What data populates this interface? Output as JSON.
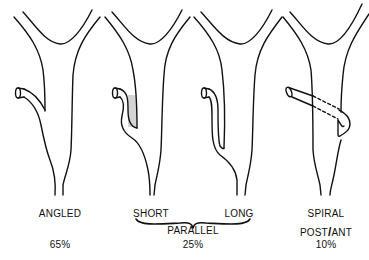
{
  "diagram": {
    "type": "anatomical schematic",
    "stroke_color": "#111111",
    "background": "#ffffff",
    "variants": [
      {
        "id": "angled",
        "label": "ANGLED",
        "percent": "65%"
      },
      {
        "id": "parallel-short",
        "label": "SHORT"
      },
      {
        "id": "parallel-long",
        "label": "LONG"
      },
      {
        "id": "spiral",
        "label": "SPIRAL",
        "sublabel_left": "POST",
        "sublabel_sep": "/",
        "sublabel_right": "ANT",
        "percent": "10%"
      }
    ],
    "parallel_group": {
      "label": "PARALLEL",
      "percent": "25%"
    }
  }
}
